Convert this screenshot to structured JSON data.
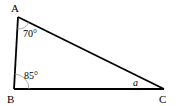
{
  "diagram": {
    "type": "triangle",
    "vertices": {
      "A": {
        "label": "A",
        "x": 18,
        "y": 17
      },
      "B": {
        "label": "B",
        "x": 14,
        "y": 89
      },
      "C": {
        "label": "C",
        "x": 164,
        "y": 89
      }
    },
    "angles": {
      "A": {
        "label": "70°"
      },
      "B": {
        "label": "85°"
      },
      "C": {
        "label": "a"
      }
    },
    "colors": {
      "stroke": "#000000",
      "arc": "#999999",
      "background": "#ffffff"
    }
  }
}
